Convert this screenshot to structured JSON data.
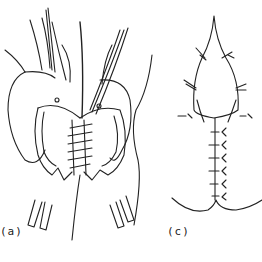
{
  "figure": {
    "panels": [
      {
        "id": "a",
        "label": "(a)",
        "description": "Tissue flaps retracted with sutures placed across midline closure"
      },
      {
        "id": "c",
        "label": "(c)",
        "description": "Teardrop-shaped incision with interrupted sutures along vertical closure line"
      }
    ],
    "colors": {
      "ink": "#222222",
      "background": "#ffffff"
    }
  }
}
